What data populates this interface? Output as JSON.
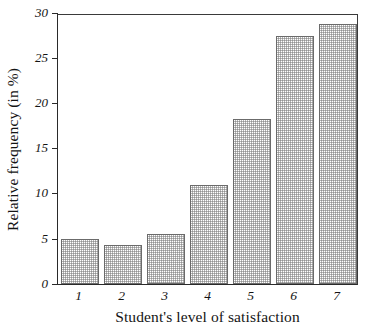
{
  "chart_data": {
    "type": "bar",
    "title": "",
    "xlabel": "Student's level of satisfaction",
    "ylabel": "Relative frequency (in %)",
    "categories": [
      "1",
      "2",
      "3",
      "4",
      "5",
      "6",
      "7"
    ],
    "values": [
      5.0,
      4.3,
      5.5,
      11.0,
      18.3,
      27.5,
      28.8
    ],
    "ylim": [
      0,
      30
    ],
    "yticks": [
      0,
      5,
      10,
      15,
      20,
      25,
      30
    ],
    "ytick_labels": [
      "0",
      "5",
      "10",
      "15",
      "20",
      "25",
      "30"
    ],
    "xtick_labels": [
      "1",
      "2",
      "3",
      "4",
      "5",
      "6",
      "7"
    ],
    "grid": false,
    "legend": null,
    "legend_position": "none",
    "bar_fill": "#e8e8e8",
    "bar_edge": "#6b6b6b",
    "axis_color": "#2a2a2a",
    "background": "#ffffff"
  }
}
